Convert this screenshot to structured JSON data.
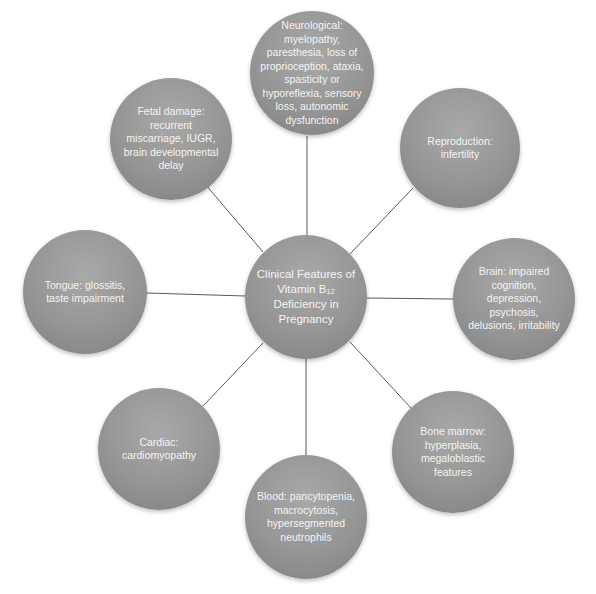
{
  "diagram": {
    "type": "hub-and-spoke",
    "center": {
      "line1": "Clinical Features of",
      "line2_prefix": "Vitamin B",
      "line2_sub": "12",
      "line3": "Deficiency in",
      "line4": "Pregnancy"
    },
    "nodes": [
      {
        "id": "neurological",
        "text": "Neurological: myelopathy, paresthesia, loss of proprioception, ataxia, spasticity or hyporeflexia, sensory loss, autonomic dysfunction"
      },
      {
        "id": "reproduction",
        "text": "Reproduction: infertility"
      },
      {
        "id": "brain",
        "text": "Brain: impaired cognition, depression, psychosis, delusions, irritability"
      },
      {
        "id": "bone-marrow",
        "text": "Bone marrow: hyperplasia, megaloblastic features"
      },
      {
        "id": "blood",
        "text": "Blood: pancytopenia, macrocytosis, hypersegmented neutrophils"
      },
      {
        "id": "cardiac",
        "text": "Cardiac: cardiomyopathy"
      },
      {
        "id": "tongue",
        "text": "Tongue: glossitis, taste impairment"
      },
      {
        "id": "fetal",
        "text": "Fetal damage: recurrent miscarriage, IUGR, brain developmental delay"
      }
    ],
    "colors": {
      "node_fill": "#959595",
      "node_text": "#f4f4f4",
      "connector": "#555555",
      "background": "#ffffff"
    }
  }
}
